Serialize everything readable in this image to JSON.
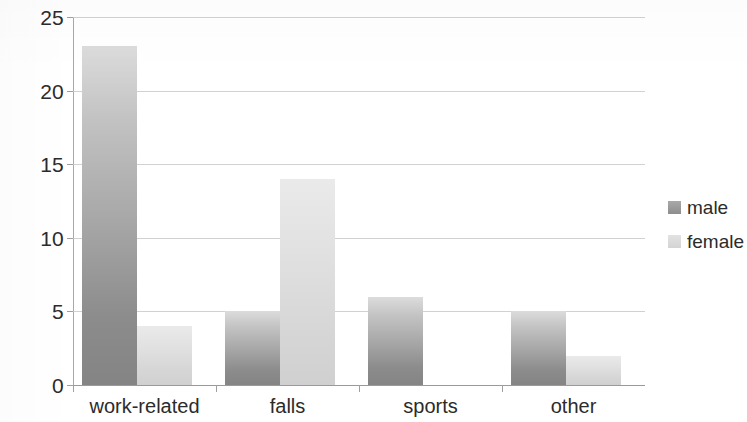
{
  "chart_data": {
    "type": "bar",
    "title": "",
    "subtitle": "",
    "xlabel": "",
    "ylabel": "",
    "categories": [
      "work-related",
      "falls",
      "sports",
      "other"
    ],
    "series": [
      {
        "name": "male",
        "values": [
          23,
          5,
          6,
          5
        ],
        "color": "#8c8c8c"
      },
      {
        "name": "female",
        "values": [
          4,
          14,
          0,
          2
        ],
        "color": "#d8d8d8"
      }
    ],
    "ylim": [
      0,
      25
    ],
    "ytick_labels": [
      "0",
      "5",
      "10",
      "15",
      "20",
      "25"
    ],
    "ytick_values": [
      0,
      5,
      10,
      15,
      20,
      25
    ],
    "grid": true,
    "grid_axis": "y",
    "legend_position": "right",
    "legend_entries": [
      "male",
      "female"
    ],
    "annotations": []
  },
  "legend": {
    "items": [
      {
        "label": "male",
        "swatch": "legend-swatch-male"
      },
      {
        "label": "female",
        "swatch": "legend-swatch-female"
      }
    ]
  },
  "axes": {
    "y_ticks": [
      "0",
      "5",
      "10",
      "15",
      "20",
      "25"
    ],
    "x_categories": [
      "work-related",
      "falls",
      "sports",
      "other"
    ]
  }
}
